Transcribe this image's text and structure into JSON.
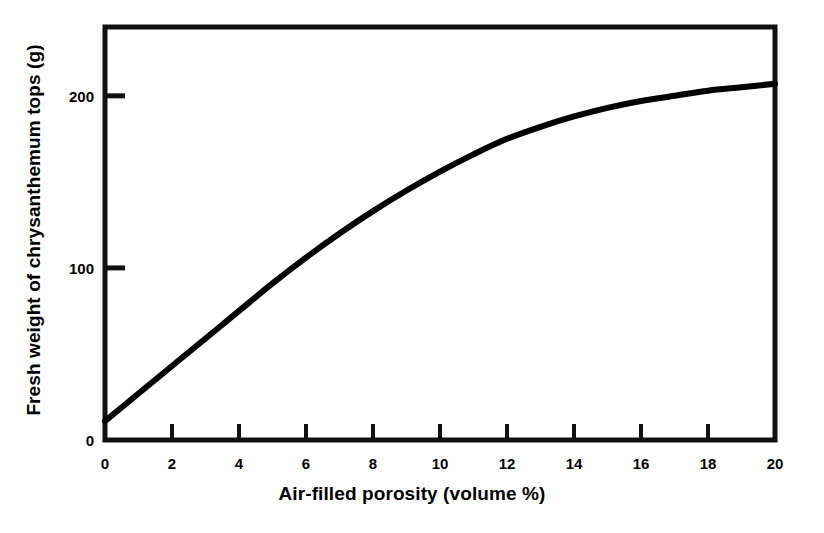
{
  "chart_data": {
    "type": "line",
    "title": "",
    "xlabel": "Air-filled porosity (volume %)",
    "ylabel": "Fresh weight of chrysanthemum tops (g)",
    "xlim": [
      0,
      20
    ],
    "ylim": [
      0,
      240
    ],
    "grid": false,
    "legend": "none",
    "x_ticks": [
      0,
      2,
      4,
      6,
      8,
      10,
      12,
      14,
      16,
      18,
      20
    ],
    "x_tick_labels": [
      "0",
      "2",
      "4",
      "6",
      "8",
      "10",
      "12",
      "14",
      "16",
      "18",
      "20"
    ],
    "y_ticks": [
      0,
      100,
      200
    ],
    "y_tick_labels": [
      "0",
      "100",
      "200"
    ],
    "series": [
      {
        "name": "Fresh weight vs air-filled porosity",
        "color": "#000000",
        "x": [
          0,
          1,
          2,
          3,
          4,
          5,
          6,
          7,
          8,
          9,
          10,
          11,
          12,
          13,
          14,
          15,
          16,
          17,
          18,
          19,
          20
        ],
        "values": [
          11,
          27,
          43,
          59,
          75,
          91,
          106,
          120,
          133,
          145,
          156,
          166,
          175,
          182,
          188,
          193,
          197,
          200,
          203,
          205,
          207
        ]
      }
    ],
    "axis_style": {
      "frame": "box",
      "line_color": "#000000",
      "line_width_px": 5,
      "tick_direction": "in"
    }
  },
  "axes": {
    "x_title": "Air-filled porosity (volume %)",
    "y_title": "Fresh weight of chrysanthemum tops (g)"
  }
}
